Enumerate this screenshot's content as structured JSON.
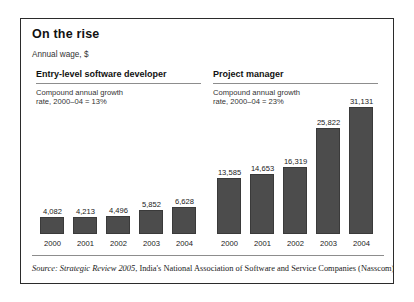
{
  "figure": {
    "title": "On the rise",
    "subtitle": "Annual wage, $",
    "source_prefix": "Source:",
    "source_italic": "Strategic Review 2005",
    "source_rest": ", India's National Association of Software and Service Companies (Nasscom)."
  },
  "panels": [
    {
      "heading": "Entry-level software developer",
      "note": "Compound annual growth\nrate, 2000–04 = 13%"
    },
    {
      "heading": "Project manager",
      "note": "Compound annual growth\nrate, 2000–04 = 23%"
    }
  ],
  "chart_data": {
    "type": "bar",
    "title": "On the rise",
    "subtitle": "Annual wage, $",
    "xlabel": "",
    "ylabel": "Annual wage, $",
    "grid": false,
    "legend": "none",
    "ylim": [
      0,
      33000
    ],
    "categories": [
      "2000",
      "2001",
      "2002",
      "2003",
      "2004"
    ],
    "series": [
      {
        "name": "Entry-level software developer",
        "cagr_label": "Compound annual growth rate, 2000–04 = 13%",
        "values": [
          4082,
          4213,
          4496,
          5852,
          6628
        ],
        "value_labels": [
          "4,082",
          "4,213",
          "4,496",
          "5,852",
          "6,628"
        ]
      },
      {
        "name": "Project manager",
        "cagr_label": "Compound annual growth rate, 2000–04 = 23%",
        "values": [
          13585,
          14653,
          16319,
          25822,
          31131
        ],
        "value_labels": [
          "13,585",
          "14,653",
          "16,319",
          "25,822",
          "31,131"
        ]
      }
    ],
    "colors": {
      "bar": "#4c4c4c",
      "bar_outline": "#3a3a3a",
      "text": "#1a1a1a",
      "rule": "#8d8d8d",
      "border": "#2b2b2b"
    }
  }
}
